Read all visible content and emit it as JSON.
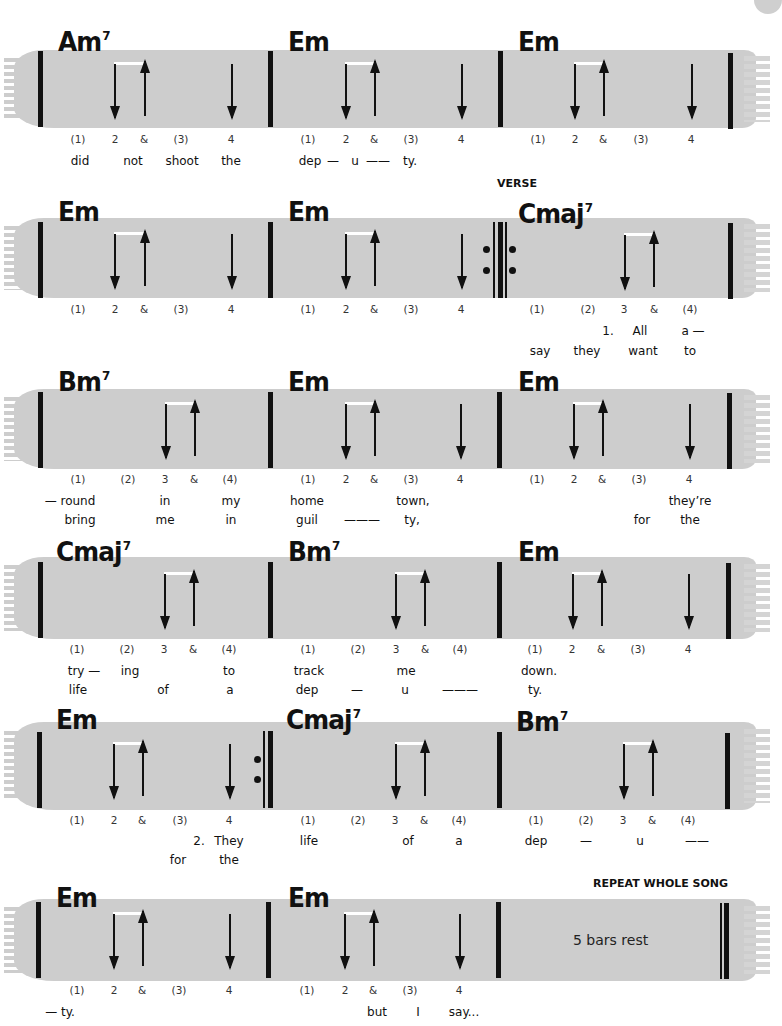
{
  "page": {
    "rows": [
      {
        "chords": [
          {
            "name": "Am",
            "ext": "7",
            "x": 46
          },
          {
            "name": "Em",
            "ext": "",
            "x": 288
          },
          {
            "name": "Em",
            "ext": "",
            "x": 517
          }
        ],
        "beats": [
          [
            "(1)",
            "2",
            "&",
            "(3)",
            "4"
          ],
          [
            "(1)",
            "2",
            "&",
            "(3)",
            "4"
          ],
          [
            "(1)",
            "2",
            "&",
            "(3)",
            "4"
          ]
        ],
        "lyrics": [
          [
            {
              "t": "did",
              "x": 80
            },
            {
              "t": "not",
              "x": 133
            },
            {
              "t": "shoot",
              "x": 182
            },
            {
              "t": "the",
              "x": 231
            },
            {
              "t": "dep",
              "x": 310
            },
            {
              "t": "—",
              "x": 333
            },
            {
              "t": "u",
              "x": 355
            },
            {
              "t": "——",
              "x": 378
            },
            {
              "t": "ty.",
              "x": 410
            }
          ]
        ]
      },
      {
        "label": "VERSE",
        "chords": [
          {
            "name": "Em",
            "ext": "",
            "x": 46
          },
          {
            "name": "Em",
            "ext": "",
            "x": 288
          },
          {
            "name": "Cmaj",
            "ext": "7",
            "x": 517
          }
        ],
        "beats": [
          [
            "(1)",
            "2",
            "&",
            "(3)",
            "4"
          ],
          [
            "(1)",
            "2",
            "&",
            "(3)",
            "4"
          ],
          [
            "(1)",
            "(2)",
            "3",
            "&",
            "(4)"
          ]
        ],
        "lyrics": [
          [
            {
              "t": "1.",
              "x": 608
            },
            {
              "t": "All",
              "x": 640
            },
            {
              "t": "a —",
              "x": 693
            }
          ],
          [
            {
              "t": "say",
              "x": 540
            },
            {
              "t": "they",
              "x": 587
            },
            {
              "t": "want",
              "x": 643
            },
            {
              "t": "to",
              "x": 690
            }
          ]
        ]
      },
      {
        "chords": [
          {
            "name": "Bm",
            "ext": "7",
            "x": 46
          },
          {
            "name": "Em",
            "ext": "",
            "x": 288
          },
          {
            "name": "Em",
            "ext": "",
            "x": 517
          }
        ],
        "beats": [
          [
            "(1)",
            "(2)",
            "3",
            "&",
            "(4)"
          ],
          [
            "(1)",
            "2",
            "&",
            "(3)",
            "4"
          ],
          [
            "(1)",
            "2",
            "&",
            "(3)",
            "4"
          ]
        ],
        "lyrics": [
          [
            {
              "t": "— round",
              "x": 70
            },
            {
              "t": "in",
              "x": 165
            },
            {
              "t": "my",
              "x": 231
            },
            {
              "t": "home",
              "x": 307
            },
            {
              "t": "town,",
              "x": 413
            },
            {
              "t": "they’re",
              "x": 690
            }
          ],
          [
            {
              "t": "bring",
              "x": 80
            },
            {
              "t": "me",
              "x": 165
            },
            {
              "t": "in",
              "x": 231
            },
            {
              "t": "guil",
              "x": 307
            },
            {
              "t": "———",
              "x": 362
            },
            {
              "t": "ty,",
              "x": 412
            },
            {
              "t": "for",
              "x": 642
            },
            {
              "t": "the",
              "x": 690
            }
          ]
        ]
      },
      {
        "chords": [
          {
            "name": "Cmaj",
            "ext": "7",
            "x": 46
          },
          {
            "name": "Bm",
            "ext": "7",
            "x": 288
          },
          {
            "name": "Em",
            "ext": "",
            "x": 517
          }
        ],
        "beats": [
          [
            "(1)",
            "(2)",
            "3",
            "&",
            "(4)"
          ],
          [
            "(1)",
            "(2)",
            "3",
            "&",
            "(4)"
          ],
          [
            "(1)",
            "2",
            "&",
            "(3)",
            "4"
          ]
        ],
        "lyrics": [
          [
            {
              "t": "try —",
              "x": 84
            },
            {
              "t": "ing",
              "x": 130
            },
            {
              "t": "to",
              "x": 229
            },
            {
              "t": "track",
              "x": 309
            },
            {
              "t": "me",
              "x": 406
            },
            {
              "t": "down.",
              "x": 539
            }
          ],
          [
            {
              "t": "life",
              "x": 78
            },
            {
              "t": "of",
              "x": 163
            },
            {
              "t": "a",
              "x": 230
            },
            {
              "t": "dep",
              "x": 307
            },
            {
              "t": "—",
              "x": 357
            },
            {
              "t": "u",
              "x": 405
            },
            {
              "t": "———",
              "x": 460
            },
            {
              "t": "ty.",
              "x": 535
            }
          ]
        ]
      },
      {
        "chords": [
          {
            "name": "Em",
            "ext": "",
            "x": 46
          },
          {
            "name": "Cmaj",
            "ext": "7",
            "x": 286
          },
          {
            "name": "Bm",
            "ext": "7",
            "x": 516
          }
        ],
        "beats": [
          [
            "(1)",
            "2",
            "&",
            "(3)",
            "4"
          ],
          [
            "(1)",
            "(2)",
            "3",
            "&",
            "(4)"
          ],
          [
            "(1)",
            "(2)",
            "3",
            "&",
            "(4)"
          ]
        ],
        "lyrics": [
          [
            {
              "t": "2.",
              "x": 199
            },
            {
              "t": "They",
              "x": 229
            },
            {
              "t": "life",
              "x": 309
            },
            {
              "t": "of",
              "x": 408
            },
            {
              "t": "a",
              "x": 459
            },
            {
              "t": "dep",
              "x": 536
            },
            {
              "t": "—",
              "x": 586
            },
            {
              "t": "u",
              "x": 640
            },
            {
              "t": "——",
              "x": 697
            }
          ],
          [
            {
              "t": "for",
              "x": 178
            },
            {
              "t": "the",
              "x": 229
            }
          ]
        ]
      },
      {
        "label": "REPEAT WHOLE SONG",
        "rest_text": "5 bars rest",
        "chords": [
          {
            "name": "Em",
            "ext": "",
            "x": 56
          },
          {
            "name": "Em",
            "ext": "",
            "x": 288
          }
        ],
        "beats": [
          [
            "(1)",
            "2",
            "&",
            "(3)",
            "4"
          ],
          [
            "(1)",
            "2",
            "&",
            "(3)",
            "4"
          ]
        ],
        "lyrics": [
          [
            {
              "t": "— ty.",
              "x": 65
            },
            {
              "t": "but",
              "x": 390
            },
            {
              "t": "I",
              "x": 418
            },
            {
              "t": "say...",
              "x": 465
            }
          ]
        ]
      }
    ]
  },
  "colors": {
    "band": "#cdcdcd",
    "ink": "#111111",
    "tie": "#ffffff"
  }
}
